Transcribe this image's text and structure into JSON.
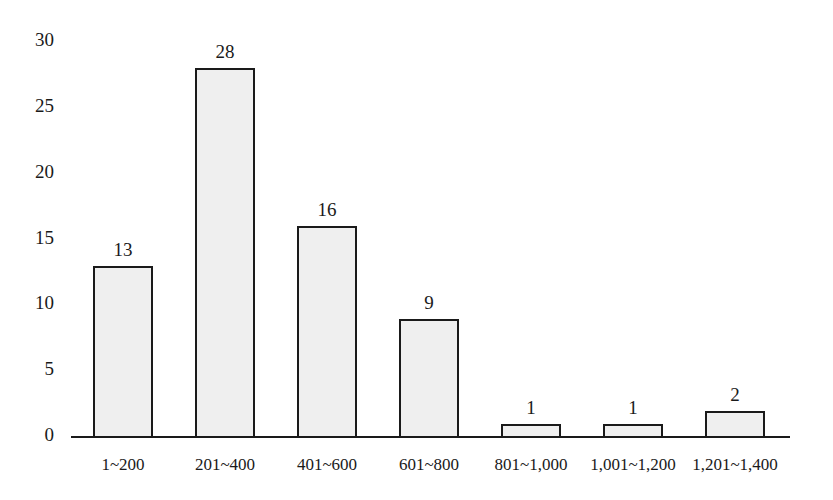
{
  "chart_data": {
    "type": "bar",
    "title": "",
    "xlabel": "",
    "ylabel": "",
    "categories": [
      "1~200",
      "201~400",
      "401~600",
      "601~800",
      "801~1,000",
      "1,001~1,200",
      "1,201~1,400"
    ],
    "values": [
      13,
      28,
      16,
      9,
      1,
      1,
      2
    ],
    "data_labels": [
      "13",
      "28",
      "16",
      "9",
      "1",
      "1",
      "2"
    ],
    "yticks": [
      "0",
      "5",
      "10",
      "15",
      "20",
      "25",
      "30"
    ],
    "ylim": [
      0,
      30
    ],
    "grid": false,
    "legend": null,
    "bar_fill": "#efefef",
    "bar_edge": "#1a1a1a"
  }
}
